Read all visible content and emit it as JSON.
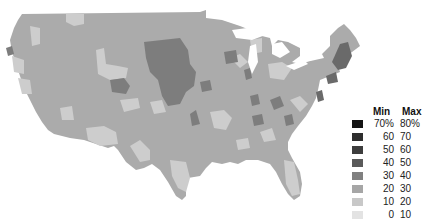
{
  "map": {
    "subject": "Contiguous United States choropleth",
    "base_color": "#a9a9a9",
    "region_colors": {
      "bin_0_10": "#e6e6e6",
      "bin_10_20": "#cfcfcf",
      "bin_20_30": "#b4b4b4",
      "bin_30_40": "#969696",
      "bin_40_50": "#787878",
      "bin_50_60": "#555555",
      "bin_60_70": "#2e2e2e",
      "bin_70_80": "#141414"
    }
  },
  "legend": {
    "header_min": "Min",
    "header_max": "Max",
    "rows": [
      {
        "min": "70%",
        "max": "80%",
        "color": "#141414"
      },
      {
        "min": "60",
        "max": "70",
        "color": "#2e2e2e"
      },
      {
        "min": "50",
        "max": "60",
        "color": "#3d3d3d"
      },
      {
        "min": "40",
        "max": "50",
        "color": "#5a5a5a"
      },
      {
        "min": "30",
        "max": "40",
        "color": "#808080"
      },
      {
        "min": "20",
        "max": "30",
        "color": "#a6a6a6"
      },
      {
        "min": "10",
        "max": "20",
        "color": "#c8c8c8"
      },
      {
        "min": "0",
        "max": "10",
        "color": "#e3e3e3"
      }
    ]
  }
}
